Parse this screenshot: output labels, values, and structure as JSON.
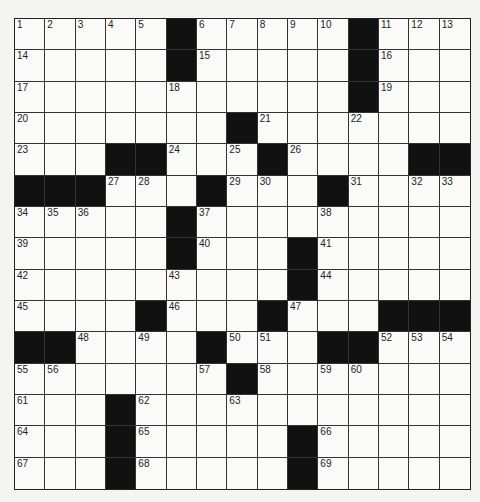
{
  "puzzle": {
    "rows": 15,
    "cols": 15,
    "grid": [
      [
        "1",
        "2",
        "3",
        "4",
        "5",
        "#",
        "6",
        "7",
        "8",
        "9",
        "10",
        "#",
        "11",
        "12",
        "13"
      ],
      [
        "14",
        "",
        "",
        "",
        "",
        "#",
        "15",
        "",
        "",
        "",
        "",
        "#",
        "16",
        "",
        ""
      ],
      [
        "17",
        "",
        "",
        "",
        "",
        "18",
        "",
        "",
        "",
        "",
        "",
        "#",
        "19",
        "",
        ""
      ],
      [
        "20",
        "",
        "",
        "",
        "",
        "",
        "",
        "#",
        "21",
        "",
        "",
        "22",
        "",
        "",
        ""
      ],
      [
        "23",
        "",
        "",
        "#",
        "#",
        "24",
        "",
        "25",
        "#",
        "26",
        "",
        "",
        "",
        "#",
        "#"
      ],
      [
        "#",
        "#",
        "#",
        "27",
        "28",
        "",
        "#",
        "29",
        "30",
        "",
        "#",
        "31",
        "",
        "32",
        "33"
      ],
      [
        "34",
        "35",
        "36",
        "",
        "",
        "#",
        "37",
        "",
        "",
        "",
        "38",
        "",
        "",
        "",
        ""
      ],
      [
        "39",
        "",
        "",
        "",
        "",
        "#",
        "40",
        "",
        "",
        "#",
        "41",
        "",
        "",
        "",
        ""
      ],
      [
        "42",
        "",
        "",
        "",
        "",
        "43",
        "",
        "",
        "",
        "#",
        "44",
        "",
        "",
        "",
        ""
      ],
      [
        "45",
        "",
        "",
        "",
        "#",
        "46",
        "",
        "",
        "#",
        "47",
        "",
        "",
        "#",
        "#",
        "#"
      ],
      [
        "#",
        "#",
        "48",
        "",
        "49",
        "",
        "#",
        "50",
        "51",
        "",
        "#",
        "#",
        "52",
        "53",
        "54"
      ],
      [
        "55",
        "56",
        "",
        "",
        "",
        "",
        "57",
        "#",
        "58",
        "",
        "59",
        "60",
        "",
        "",
        ""
      ],
      [
        "61",
        "",
        "",
        "#",
        "62",
        "",
        "",
        "63",
        "",
        "",
        "",
        "",
        "",
        "",
        ""
      ],
      [
        "64",
        "",
        "",
        "#",
        "65",
        "",
        "",
        "",
        "",
        "#",
        "66",
        "",
        "",
        "",
        ""
      ],
      [
        "67",
        "",
        "",
        "#",
        "68",
        "",
        "",
        "",
        "",
        "#",
        "69",
        "",
        "",
        "",
        ""
      ]
    ]
  }
}
